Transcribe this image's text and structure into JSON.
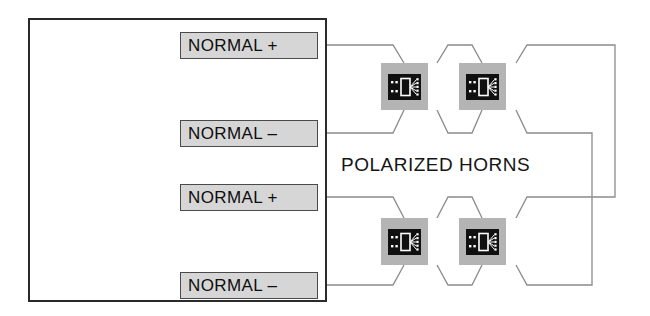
{
  "diagram": {
    "title": "POLARIZED HORNS",
    "center_label": "POLARIZED HORNS",
    "colors": {
      "panel_border": "#2a2a2a",
      "terminal_fill": "#d6d6d6",
      "terminal_border": "#4a4a4a",
      "horn_body": "#b4b4b4",
      "horn_icon_bg": "#101010",
      "horn_icon_line": "#ffffff",
      "wire": "#8a8a8a",
      "background": "#ffffff",
      "text": "#0d0d0d"
    },
    "panel": {
      "name": "control-panel"
    },
    "terminals": [
      {
        "label": "NORMAL +",
        "polarity": "+",
        "index": 1
      },
      {
        "label": "NORMAL –",
        "polarity": "–",
        "index": 2
      },
      {
        "label": "NORMAL +",
        "polarity": "+",
        "index": 3
      },
      {
        "label": "NORMAL –",
        "polarity": "–",
        "index": 4
      }
    ],
    "horns": [
      {
        "name": "polarized-horn-1",
        "position": "top-left",
        "icon": "polarized-horn-icon"
      },
      {
        "name": "polarized-horn-2",
        "position": "top-right",
        "icon": "polarized-horn-icon"
      },
      {
        "name": "polarized-horn-3",
        "position": "bottom-left",
        "icon": "polarized-horn-icon"
      },
      {
        "name": "polarized-horn-4",
        "position": "bottom-right",
        "icon": "polarized-horn-icon"
      }
    ]
  }
}
